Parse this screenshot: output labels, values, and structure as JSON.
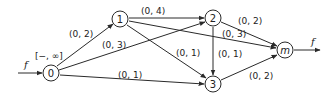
{
  "diagram": {
    "type": "flow-network",
    "colors": {
      "stroke": "#2a2a2a",
      "text": "#222222",
      "background": "#ffffff"
    },
    "nodes": [
      {
        "id": "0",
        "label": "0",
        "x": 51,
        "y": 73
      },
      {
        "id": "1",
        "label": "1",
        "x": 120,
        "y": 19
      },
      {
        "id": "2",
        "label": "2",
        "x": 213,
        "y": 18
      },
      {
        "id": "3",
        "label": "3",
        "x": 213,
        "y": 84
      },
      {
        "id": "m",
        "label": "m",
        "x": 285,
        "y": 50
      }
    ],
    "node_annotations": [
      {
        "node": "0",
        "label": "[−, ∞]"
      }
    ],
    "edges": [
      {
        "from": "0",
        "to": "1",
        "label": "(0, 2)"
      },
      {
        "from": "0",
        "to": "2",
        "label": "(0, 3)"
      },
      {
        "from": "0",
        "to": "3",
        "label": "(0, 1)"
      },
      {
        "from": "1",
        "to": "2",
        "label": "(0, 4)"
      },
      {
        "from": "1",
        "to": "3",
        "label": "(0, 1)"
      },
      {
        "from": "1",
        "to": "m",
        "label": "(0, 3)"
      },
      {
        "from": "2",
        "to": "3",
        "label": "(0, 1)"
      },
      {
        "from": "2",
        "to": "m",
        "label": "(0, 2)"
      },
      {
        "from": "3",
        "to": "m",
        "label": "(0, 2)"
      }
    ],
    "source_flow_label": "f",
    "sink_flow_label": "f"
  }
}
